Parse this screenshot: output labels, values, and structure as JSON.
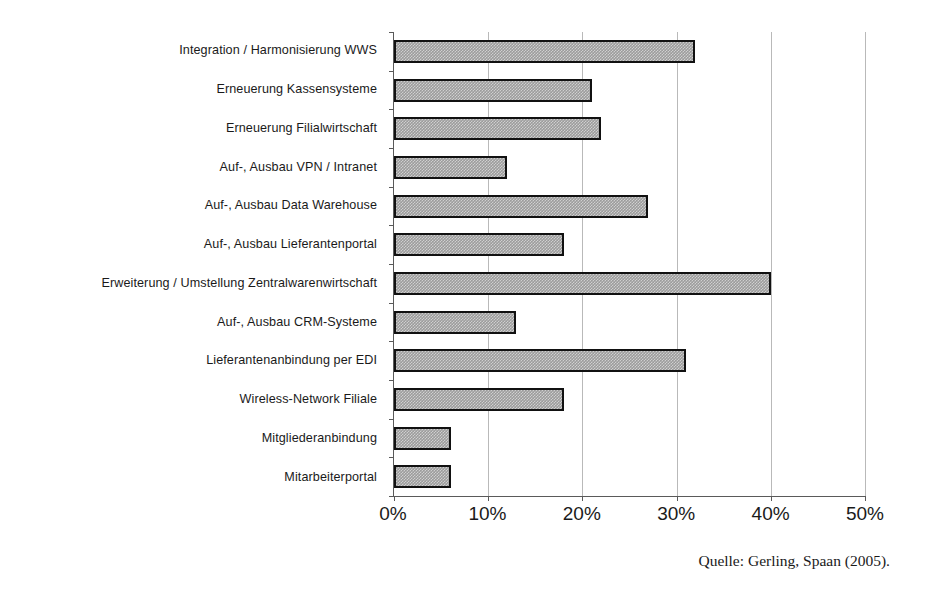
{
  "chart_data": {
    "type": "bar",
    "orientation": "horizontal",
    "title": "",
    "xlabel": "",
    "ylabel": "",
    "xlim": [
      0,
      50
    ],
    "xtick_labels": [
      "0%",
      "10%",
      "20%",
      "30%",
      "40%",
      "50%"
    ],
    "xticks": [
      0,
      10,
      20,
      30,
      40,
      50
    ],
    "grid": "vertical",
    "legend": "none",
    "unit": "%",
    "categories": [
      "Integration / Harmonisierung WWS",
      "Erneuerung Kassensysteme",
      "Erneuerung Filialwirtschaft",
      "Auf-, Ausbau VPN / Intranet",
      "Auf-, Ausbau Data Warehouse",
      "Auf-, Ausbau Lieferantenportal",
      "Erweiterung / Umstellung Zentralwarenwirtschaft",
      "Auf-, Ausbau CRM-Systeme",
      "Lieferantenanbindung per EDI",
      "Wireless-Network Filiale",
      "Mitgliederanbindung",
      "Mitarbeiterportal"
    ],
    "values": [
      32,
      21,
      22,
      12,
      27,
      18,
      40,
      13,
      31,
      18,
      6,
      6
    ],
    "bar_fill_color": "#9c9c9c",
    "bar_border_color": "#111111",
    "gridline_color": "#b9b9b9",
    "axis_color": "#5a5a5a"
  },
  "source_note": "Quelle: Gerling, Spaan (2005)."
}
